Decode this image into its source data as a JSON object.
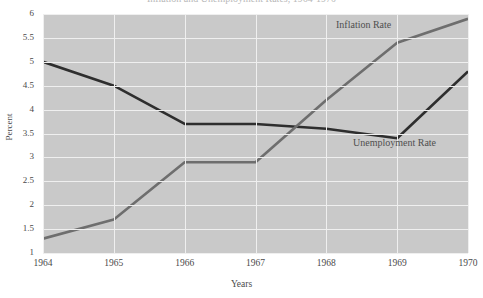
{
  "figure": {
    "title_clipped": "Inflation and Unemployment Rates, 1964-1970",
    "plot_background_color": "#c9c9c9",
    "gridline_color": "#efefef"
  },
  "axes": {
    "y": {
      "label": "Percent",
      "ticks": [
        "6",
        "5.5",
        "5",
        "4.5",
        "4",
        "3.5",
        "3",
        "2.5",
        "2",
        "1.5",
        "1"
      ]
    },
    "x": {
      "label": "Years",
      "ticks": [
        "1964",
        "1965",
        "1966",
        "1967",
        "1968",
        "1969",
        "1970"
      ]
    }
  },
  "series_labels": {
    "inflation": "Inflation Rate",
    "unemployment": "Unemployment Rate"
  },
  "chart_data": {
    "type": "line",
    "title": "Inflation and Unemployment Rates, 1964-1970",
    "xlabel": "Years",
    "ylabel": "Percent",
    "x": [
      1964,
      1965,
      1966,
      1967,
      1968,
      1969,
      1970
    ],
    "xtick_labels": [
      "1964",
      "1965",
      "1966",
      "1967",
      "1968",
      "1969",
      "1970"
    ],
    "ytick_labels": [
      "1",
      "1.5",
      "2",
      "2.5",
      "3",
      "3.5",
      "4",
      "4.5",
      "5",
      "5.5",
      "6"
    ],
    "ylim": [
      1,
      6
    ],
    "xlim": [
      1964,
      1970
    ],
    "grid": true,
    "legend": "inline-annotations",
    "series": [
      {
        "name": "Unemployment Rate",
        "color": "#2e2e2e",
        "values": [
          5.0,
          4.5,
          3.7,
          3.7,
          3.6,
          3.4,
          4.8
        ]
      },
      {
        "name": "Inflation Rate",
        "color": "#6e6e6e",
        "values": [
          1.3,
          1.7,
          2.9,
          2.9,
          4.2,
          5.4,
          5.9
        ]
      }
    ],
    "annotations": [
      {
        "text": "Inflation Rate",
        "x": 1968.15,
        "y": 5.78
      },
      {
        "text": "Unemployment Rate",
        "x": 1968.4,
        "y": 3.3
      }
    ]
  }
}
